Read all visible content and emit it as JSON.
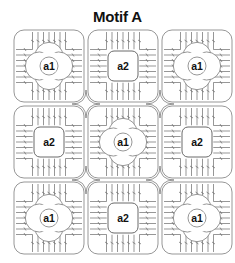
{
  "title": "Motif A",
  "colors": {
    "line": "#6a6a6a",
    "text": "#111111",
    "background": "#ffffff"
  },
  "grid": {
    "rows": 3,
    "cols": 3,
    "cells": [
      {
        "row": 0,
        "col": 0,
        "label": "a1",
        "type": "flower"
      },
      {
        "row": 0,
        "col": 1,
        "label": "a2",
        "type": "square"
      },
      {
        "row": 0,
        "col": 2,
        "label": "a1",
        "type": "flower"
      },
      {
        "row": 1,
        "col": 0,
        "label": "a2",
        "type": "square"
      },
      {
        "row": 1,
        "col": 1,
        "label": "a1",
        "type": "flower"
      },
      {
        "row": 1,
        "col": 2,
        "label": "a2",
        "type": "square"
      },
      {
        "row": 2,
        "col": 0,
        "label": "a1",
        "type": "flower"
      },
      {
        "row": 2,
        "col": 1,
        "label": "a2",
        "type": "square"
      },
      {
        "row": 2,
        "col": 2,
        "label": "a1",
        "type": "flower"
      }
    ]
  }
}
